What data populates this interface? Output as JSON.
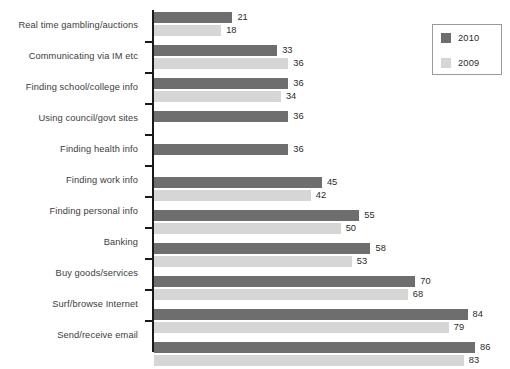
{
  "chart_data": {
    "type": "bar",
    "orientation": "horizontal",
    "title": "",
    "subtitle": "",
    "xlabel": "",
    "ylabel": "",
    "grid": false,
    "xlim": [
      0,
      86
    ],
    "legend_position": "top-right",
    "categories": [
      "Real time gambling/auctions",
      "Communicating via IM etc",
      "Finding school/college info",
      "Using council/govt sites",
      "Finding health info",
      "Finding work info",
      "Finding personal info",
      "Banking",
      "Buy goods/services",
      "Surf/browse Internet",
      "Send/receive email"
    ],
    "series": [
      {
        "name": "2010",
        "color": "#6e6e6e",
        "values": [
          21,
          33,
          36,
          36,
          36,
          45,
          55,
          58,
          70,
          84,
          86
        ]
      },
      {
        "name": "2009",
        "color": "#d6d6d6",
        "values": [
          18,
          36,
          34,
          null,
          null,
          42,
          50,
          53,
          68,
          79,
          83
        ]
      }
    ]
  },
  "legend": {
    "items": [
      {
        "label": "2010",
        "color": "#6e6e6e"
      },
      {
        "label": "2009",
        "color": "#d6d6d6"
      }
    ]
  },
  "footer": {
    "note": ""
  }
}
